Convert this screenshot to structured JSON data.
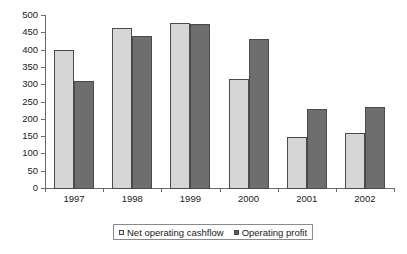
{
  "chart_data": {
    "type": "bar",
    "title": "",
    "subtitle": "",
    "xlabel": "",
    "ylabel": "",
    "categories": [
      "1997",
      "1998",
      "1999",
      "2000",
      "2001",
      "2002"
    ],
    "series": [
      {
        "name": "Net operating cashflow",
        "color": "#d6d6d6",
        "values": [
          400,
          462,
          478,
          315,
          147,
          158
        ]
      },
      {
        "name": "Operating profit",
        "color": "#6e6e6e",
        "values": [
          308,
          440,
          473,
          430,
          228,
          234
        ]
      }
    ],
    "ylim": [
      0,
      500
    ],
    "ytick_step": 50,
    "ytick_labels": [
      "0",
      "50",
      "100",
      "150",
      "200",
      "250",
      "300",
      "350",
      "400",
      "450",
      "500"
    ],
    "grid": false,
    "legend_position": "bottom",
    "axis_color": "#6b6b6b",
    "bar_border_color": "#4a4a4a",
    "background": "#ffffff"
  },
  "legend": {
    "entries": [
      {
        "label": "Net operating cashflow",
        "marker": "legend-swatch-light"
      },
      {
        "label": "Operating profit",
        "marker": "legend-swatch-dark"
      }
    ]
  }
}
